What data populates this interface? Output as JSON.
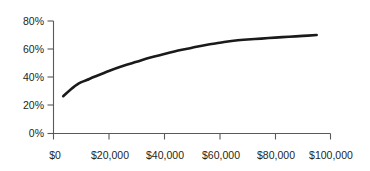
{
  "chart_data": {
    "type": "line",
    "title": "",
    "subtitle": "",
    "xlabel": "",
    "ylabel": "",
    "xlim": [
      0,
      100000
    ],
    "ylim": [
      0,
      0.8
    ],
    "grid": false,
    "legend": false,
    "legend_position": "none",
    "series_color": "#1a1a1a",
    "axis_color": "#58595b",
    "text_color": "#231f20",
    "background_color": "#ffffff",
    "x_tick_labels": [
      "$0",
      "$20,000",
      "$40,000",
      "$60,000",
      "$80,000",
      "$100,000"
    ],
    "x_tick_values": [
      0,
      20000,
      40000,
      60000,
      80000,
      100000
    ],
    "y_tick_labels": [
      "0%",
      "20%",
      "40%",
      "60%",
      "80%"
    ],
    "y_tick_values": [
      0,
      20,
      40,
      60,
      80
    ],
    "series": [
      {
        "name": "",
        "x": [
          3500,
          6000,
          9000,
          12000,
          15000,
          20000,
          25000,
          30000,
          35000,
          40000,
          45000,
          50000,
          55000,
          60000,
          65000,
          70000,
          75000,
          80000,
          85000,
          90000,
          95000
        ],
        "values": [
          26.5,
          31.0,
          35.5,
          38.0,
          40.5,
          44.5,
          48.0,
          51.0,
          54.0,
          56.5,
          59.0,
          61.0,
          63.0,
          64.5,
          66.0,
          66.8,
          67.5,
          68.2,
          68.8,
          69.4,
          70.0
        ]
      }
    ]
  }
}
